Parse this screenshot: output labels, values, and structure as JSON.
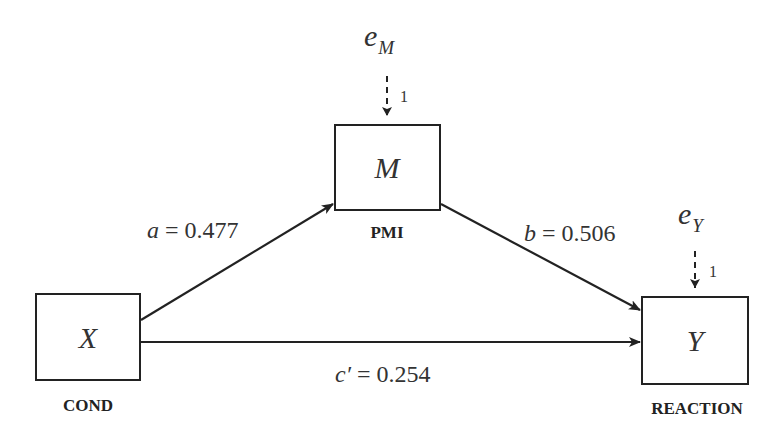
{
  "diagram": {
    "type": "mediation-path-diagram",
    "nodes": {
      "x": {
        "symbol": "X",
        "label": "COND"
      },
      "m": {
        "symbol": "M",
        "label": "PMI"
      },
      "y": {
        "symbol": "Y",
        "label": "REACTION"
      }
    },
    "errors": {
      "m": {
        "base": "e",
        "sub": "M",
        "weight": "1"
      },
      "y": {
        "base": "e",
        "sub": "Y",
        "weight": "1"
      }
    },
    "paths": {
      "a": {
        "name": "a",
        "eq": " = ",
        "value": "0.477"
      },
      "b": {
        "name": "b",
        "eq": " = ",
        "value": "0.506"
      },
      "c_prime": {
        "name": "c′",
        "eq": " = ",
        "value": "0.254"
      }
    },
    "colors": {
      "stroke": "#222222",
      "text": "#333333",
      "background": "#ffffff"
    }
  }
}
